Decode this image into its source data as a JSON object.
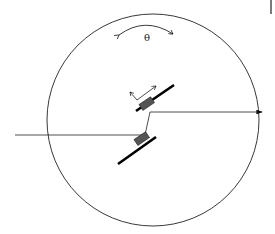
{
  "diagram": {
    "angle_label": "θ",
    "colors": {
      "stroke": "#111111",
      "mount": "#555555",
      "background": "#ffffff"
    }
  }
}
